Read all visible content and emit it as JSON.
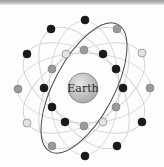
{
  "diagram": {
    "center_label": "Earth",
    "center": {
      "x": 83,
      "y": 88,
      "r": 15
    },
    "colors": {
      "black_satellite": "#1a1a1a",
      "grey_satellite": "#9a9a9a",
      "light_satellite": "#e2e2e2",
      "earth_fill": "#bdbdbd",
      "highlight_orbit": "#4a4a4a",
      "faint_orbit": "#cfcfcf"
    },
    "satellites": [
      {
        "x": 85,
        "y": 20,
        "type": "black"
      },
      {
        "x": 51,
        "y": 29,
        "type": "black"
      },
      {
        "x": 117,
        "y": 29,
        "type": "grey"
      },
      {
        "x": 27,
        "y": 54,
        "type": "black"
      },
      {
        "x": 66,
        "y": 54,
        "type": "light"
      },
      {
        "x": 84,
        "y": 50,
        "type": "grey"
      },
      {
        "x": 103,
        "y": 54,
        "type": "black"
      },
      {
        "x": 142,
        "y": 53,
        "type": "light"
      },
      {
        "x": 52,
        "y": 69,
        "type": "grey"
      },
      {
        "x": 116,
        "y": 69,
        "type": "black"
      },
      {
        "x": 18,
        "y": 89,
        "type": "grey"
      },
      {
        "x": 44,
        "y": 88,
        "type": "black"
      },
      {
        "x": 123,
        "y": 88,
        "type": "black"
      },
      {
        "x": 150,
        "y": 88,
        "type": "grey"
      },
      {
        "x": 52,
        "y": 107,
        "type": "black"
      },
      {
        "x": 116,
        "y": 107,
        "type": "grey"
      },
      {
        "x": 27,
        "y": 123,
        "type": "light"
      },
      {
        "x": 65,
        "y": 122,
        "type": "black"
      },
      {
        "x": 84,
        "y": 126,
        "type": "grey"
      },
      {
        "x": 103,
        "y": 122,
        "type": "light"
      },
      {
        "x": 142,
        "y": 122,
        "type": "black"
      },
      {
        "x": 52,
        "y": 146,
        "type": "grey"
      },
      {
        "x": 117,
        "y": 146,
        "type": "black"
      },
      {
        "x": 85,
        "y": 156,
        "type": "black"
      }
    ]
  }
}
